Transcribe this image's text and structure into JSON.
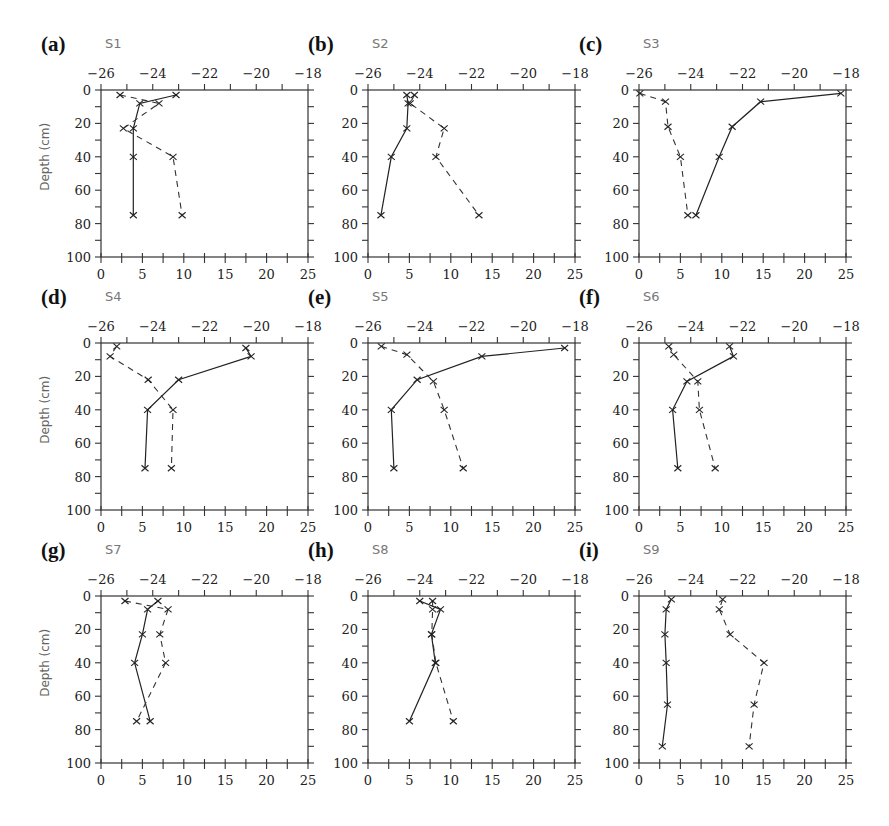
{
  "figure": {
    "depth_axis_label": "Depth (cm)",
    "layout": {
      "columns": 3,
      "rows": 3
    }
  },
  "chart_data": [
    {
      "type": "line",
      "panel": "(a)",
      "title": "S1",
      "ylabel": "Depth (cm)",
      "ylim": [
        100,
        0
      ],
      "yticks": [
        0,
        20,
        40,
        60,
        80,
        100
      ],
      "bottom_axis": {
        "range": [
          0,
          25
        ],
        "ticks": [
          0,
          5,
          10,
          15,
          20,
          25
        ]
      },
      "top_axis": {
        "range": [
          -26,
          -18
        ],
        "ticks": [
          -26,
          -24,
          -22,
          -20,
          -18
        ]
      },
      "series": [
        {
          "name": "solid (top axis)",
          "style": "solid",
          "axis": "top",
          "depth": [
            3,
            8,
            23,
            40,
            75
          ],
          "values": [
            -23.1,
            -24.5,
            -24.75,
            -24.75,
            -24.75
          ]
        },
        {
          "name": "dashed (bottom axis)",
          "style": "dashed",
          "axis": "bottom",
          "depth": [
            3,
            8,
            23,
            40,
            75
          ],
          "values": [
            2.3,
            7.0,
            2.7,
            8.7,
            9.8
          ]
        }
      ]
    },
    {
      "type": "line",
      "panel": "(b)",
      "title": "S2",
      "ylabel": "",
      "ylim": [
        100,
        0
      ],
      "yticks": [
        0,
        20,
        40,
        60,
        80,
        100
      ],
      "bottom_axis": {
        "range": [
          0,
          25
        ],
        "ticks": [
          0,
          5,
          10,
          15,
          20,
          25
        ]
      },
      "top_axis": {
        "range": [
          -26,
          -18
        ],
        "ticks": [
          -26,
          -24,
          -22,
          -20,
          -18
        ]
      },
      "series": [
        {
          "name": "solid (top axis)",
          "style": "solid",
          "axis": "top",
          "depth": [
            3,
            8,
            23,
            40,
            75
          ],
          "values": [
            -24.5,
            -24.45,
            -24.5,
            -25.1,
            -25.5
          ]
        },
        {
          "name": "dashed (bottom axis)",
          "style": "dashed",
          "axis": "bottom",
          "depth": [
            3,
            8,
            23,
            40,
            75
          ],
          "values": [
            5.6,
            5.1,
            9.2,
            8.2,
            13.4
          ]
        }
      ]
    },
    {
      "type": "line",
      "panel": "(c)",
      "title": "S3",
      "ylabel": "",
      "ylim": [
        100,
        0
      ],
      "yticks": [
        0,
        20,
        40,
        60,
        80,
        100
      ],
      "bottom_axis": {
        "range": [
          0,
          25
        ],
        "ticks": [
          0,
          5,
          10,
          15,
          20,
          25
        ]
      },
      "top_axis": {
        "range": [
          -26,
          -18
        ],
        "ticks": [
          -26,
          -24,
          -22,
          -20,
          -18
        ]
      },
      "series": [
        {
          "name": "solid (top axis)",
          "style": "solid",
          "axis": "top",
          "depth": [
            2,
            7,
            22,
            40,
            75
          ],
          "values": [
            -18.2,
            -21.3,
            -22.4,
            -22.9,
            -23.8
          ]
        },
        {
          "name": "dashed (bottom axis)",
          "style": "dashed",
          "axis": "bottom",
          "depth": [
            2,
            7,
            22,
            40,
            75
          ],
          "values": [
            0.1,
            3.2,
            3.5,
            5.0,
            5.9
          ]
        }
      ]
    },
    {
      "type": "line",
      "panel": "(d)",
      "title": "S4",
      "ylabel": "Depth (cm)",
      "ylim": [
        100,
        0
      ],
      "yticks": [
        0,
        20,
        40,
        60,
        80,
        100
      ],
      "bottom_axis": {
        "range": [
          0,
          25
        ],
        "ticks": [
          0,
          5,
          10,
          15,
          20,
          25
        ]
      },
      "top_axis": {
        "range": [
          -26,
          -18
        ],
        "ticks": [
          -26,
          -24,
          -22,
          -20,
          -18
        ]
      },
      "series": [
        {
          "name": "solid (top axis)",
          "style": "solid",
          "axis": "top",
          "depth": [
            3,
            8,
            22,
            40,
            75
          ],
          "values": [
            -20.4,
            -20.2,
            -23.0,
            -24.2,
            -24.3
          ]
        },
        {
          "name": "dashed (bottom axis)",
          "style": "dashed",
          "axis": "bottom",
          "depth": [
            2,
            8,
            22,
            40,
            75
          ],
          "values": [
            1.9,
            1.1,
            5.7,
            8.7,
            8.5
          ]
        }
      ]
    },
    {
      "type": "line",
      "panel": "(e)",
      "title": "S5",
      "ylabel": "",
      "ylim": [
        100,
        0
      ],
      "yticks": [
        0,
        20,
        40,
        60,
        80,
        100
      ],
      "bottom_axis": {
        "range": [
          0,
          25
        ],
        "ticks": [
          0,
          5,
          10,
          15,
          20,
          25
        ]
      },
      "top_axis": {
        "range": [
          -26,
          -18
        ],
        "ticks": [
          -26,
          -24,
          -22,
          -20,
          -18
        ]
      },
      "series": [
        {
          "name": "solid (top axis)",
          "style": "solid",
          "axis": "top",
          "depth": [
            3,
            8,
            22,
            40,
            75
          ],
          "values": [
            -18.4,
            -21.6,
            -24.1,
            -25.1,
            -25.0
          ]
        },
        {
          "name": "dashed (bottom axis)",
          "style": "dashed",
          "axis": "bottom",
          "depth": [
            2,
            7,
            23,
            40,
            75
          ],
          "values": [
            1.6,
            4.7,
            7.9,
            9.2,
            11.5
          ]
        }
      ]
    },
    {
      "type": "line",
      "panel": "(f)",
      "title": "S6",
      "ylabel": "",
      "ylim": [
        100,
        0
      ],
      "yticks": [
        0,
        20,
        40,
        60,
        80,
        100
      ],
      "bottom_axis": {
        "range": [
          0,
          25
        ],
        "ticks": [
          0,
          5,
          10,
          15,
          20,
          25
        ]
      },
      "top_axis": {
        "range": [
          -26,
          -18
        ],
        "ticks": [
          -26,
          -24,
          -22,
          -20,
          -18
        ]
      },
      "series": [
        {
          "name": "solid (top axis)",
          "style": "solid",
          "axis": "top",
          "depth": [
            2,
            8,
            23,
            40,
            75
          ],
          "values": [
            -22.5,
            -22.35,
            -24.15,
            -24.7,
            -24.5
          ]
        },
        {
          "name": "dashed (bottom axis)",
          "style": "dashed",
          "axis": "bottom",
          "depth": [
            2,
            7,
            23,
            40,
            75
          ],
          "values": [
            3.6,
            4.2,
            7.1,
            7.3,
            9.2
          ]
        }
      ]
    },
    {
      "type": "line",
      "panel": "(g)",
      "title": "S7",
      "ylabel": "Depth (cm)",
      "ylim": [
        100,
        0
      ],
      "yticks": [
        0,
        20,
        40,
        60,
        80,
        100
      ],
      "bottom_axis": {
        "range": [
          0,
          25
        ],
        "ticks": [
          0,
          5,
          10,
          15,
          20,
          25
        ]
      },
      "top_axis": {
        "range": [
          -26,
          -18
        ],
        "ticks": [
          -26,
          -24,
          -22,
          -20,
          -18
        ]
      },
      "series": [
        {
          "name": "solid (top axis)",
          "style": "solid",
          "axis": "top",
          "depth": [
            3,
            8,
            23,
            40,
            75
          ],
          "values": [
            -23.8,
            -24.2,
            -24.4,
            -24.7,
            -24.1
          ]
        },
        {
          "name": "dashed (bottom axis)",
          "style": "dashed",
          "axis": "bottom",
          "depth": [
            3,
            8,
            23,
            40,
            75
          ],
          "values": [
            2.9,
            8.1,
            7.1,
            7.8,
            4.3
          ]
        }
      ]
    },
    {
      "type": "line",
      "panel": "(h)",
      "title": "S8",
      "ylabel": "",
      "ylim": [
        100,
        0
      ],
      "yticks": [
        0,
        20,
        40,
        60,
        80,
        100
      ],
      "bottom_axis": {
        "range": [
          0,
          25
        ],
        "ticks": [
          0,
          5,
          10,
          15,
          20,
          25
        ]
      },
      "top_axis": {
        "range": [
          -26,
          -18
        ],
        "ticks": [
          -26,
          -24,
          -22,
          -20,
          -18
        ]
      },
      "series": [
        {
          "name": "solid (top axis)",
          "style": "solid",
          "axis": "top",
          "depth": [
            3,
            8,
            23,
            40,
            75
          ],
          "values": [
            -24.0,
            -23.2,
            -23.55,
            -23.4,
            -24.4
          ]
        },
        {
          "name": "dashed (bottom axis)",
          "style": "dashed",
          "axis": "bottom",
          "depth": [
            3,
            8,
            23,
            40,
            75
          ],
          "values": [
            7.8,
            7.8,
            7.7,
            8.2,
            10.3
          ]
        }
      ]
    },
    {
      "type": "line",
      "panel": "(i)",
      "title": "S9",
      "ylabel": "",
      "ylim": [
        100,
        0
      ],
      "yticks": [
        0,
        20,
        40,
        60,
        80,
        100
      ],
      "bottom_axis": {
        "range": [
          0,
          25
        ],
        "ticks": [
          0,
          5,
          10,
          15,
          20,
          25
        ]
      },
      "top_axis": {
        "range": [
          -26,
          -18
        ],
        "ticks": [
          -26,
          -24,
          -22,
          -20,
          -18
        ]
      },
      "series": [
        {
          "name": "solid (top axis)",
          "style": "solid",
          "axis": "top",
          "depth": [
            2,
            8,
            23,
            40,
            65,
            90
          ],
          "values": [
            -24.75,
            -24.95,
            -25.0,
            -24.95,
            -24.9,
            -25.1
          ]
        },
        {
          "name": "dashed (bottom axis)",
          "style": "dashed",
          "axis": "bottom",
          "depth": [
            2,
            8,
            23,
            40,
            65,
            90
          ],
          "values": [
            10.1,
            9.7,
            11.0,
            15.1,
            13.9,
            13.3
          ]
        }
      ]
    }
  ]
}
